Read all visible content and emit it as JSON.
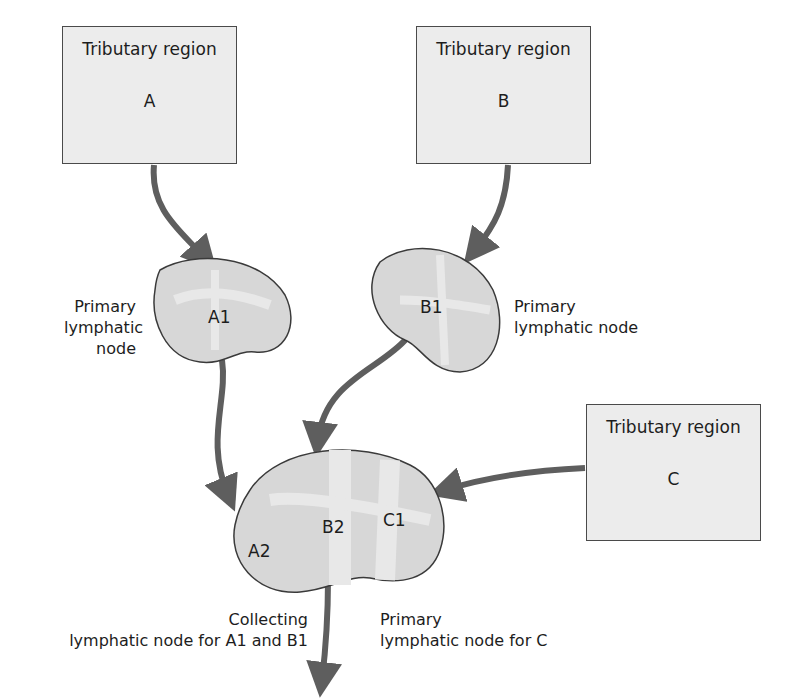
{
  "regions": [
    {
      "id": "A",
      "title": "Tributary region",
      "letter": "A"
    },
    {
      "id": "B",
      "title": "Tributary region",
      "letter": "B"
    },
    {
      "id": "C",
      "title": "Tributary region",
      "letter": "C"
    }
  ],
  "nodes": {
    "a1": "A1",
    "b1": "B1",
    "a2": "A2",
    "b2": "B2",
    "c1": "C1"
  },
  "labels": {
    "a1": {
      "line1": "Primary",
      "line2": "lymphatic",
      "line3": "node"
    },
    "b1": {
      "line1": "Primary",
      "line2": "lymphatic node"
    },
    "collecting": {
      "line1": "Collecting",
      "line2": "lymphatic node for A1 and B1"
    },
    "primary_c": {
      "line1": "Primary",
      "line2": "lymphatic node for C"
    }
  },
  "colors": {
    "arrow": "#5e5e5e",
    "node_fill": "#d7d7d7",
    "node_inner": "#e8e8e8",
    "box_fill": "#ececec"
  }
}
